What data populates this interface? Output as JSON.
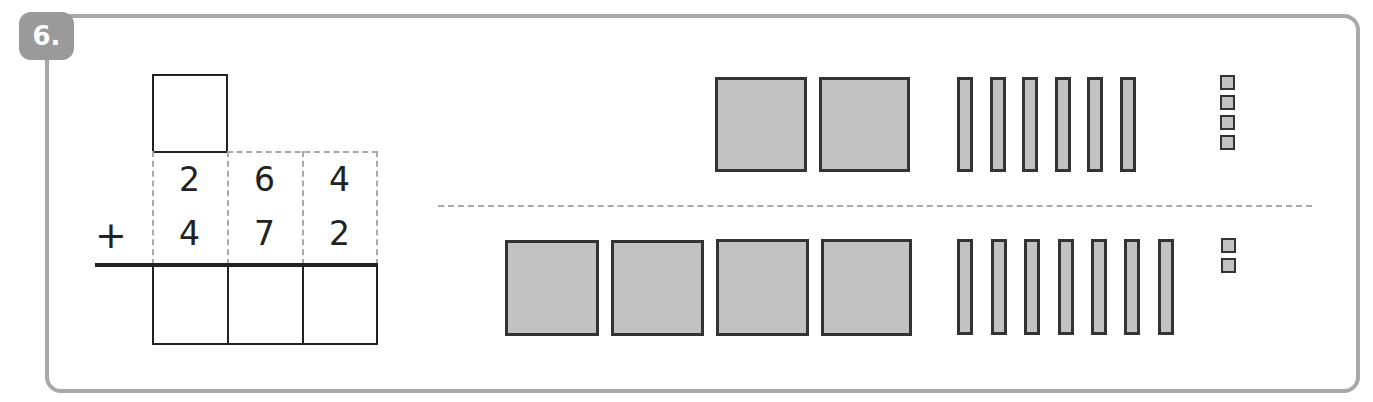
{
  "exercise": {
    "number_label": "6.",
    "operator": "+",
    "addend_1": [
      "2",
      "6",
      "4"
    ],
    "addend_2": [
      "4",
      "7",
      "2"
    ],
    "carry_box": "",
    "answer_boxes": [
      "",
      "",
      ""
    ]
  },
  "base_ten_blocks": {
    "top_row": {
      "hundreds": 2,
      "tens": 6,
      "ones": 4
    },
    "bottom_row": {
      "hundreds": 4,
      "tens": 7,
      "ones": 2
    }
  },
  "colors": {
    "frame": "#a9a9a9",
    "badge": "#9a9a9a",
    "block_fill": "#c2c2c2",
    "block_border": "#333333",
    "ink": "#222222"
  }
}
